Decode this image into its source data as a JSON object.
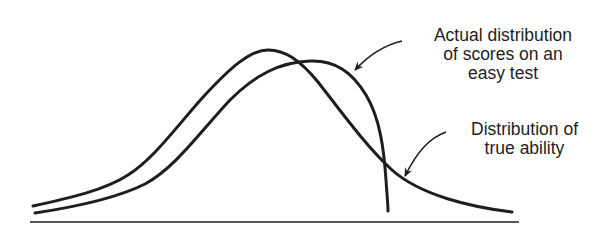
{
  "diagram": {
    "curves": [
      {
        "name": "Distribution of true ability",
        "peak_x": 268,
        "shape": "symmetric bell curve, smooth right tail"
      },
      {
        "name": "Actual distribution of scores on an easy test",
        "peak_x": 312,
        "shape": "bell curve shifted right, truncated with steep drop near the ceiling"
      }
    ],
    "annotations": {
      "actual": {
        "lines": [
          "Actual distribution",
          "of scores on an",
          "easy test"
        ]
      },
      "true_ability": {
        "lines": [
          "Distribution of",
          "true ability"
        ]
      }
    },
    "colors": {
      "stroke": "#1e1e1e",
      "background": "#ffffff"
    }
  }
}
